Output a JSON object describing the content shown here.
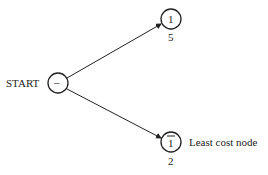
{
  "diagram": {
    "root": {
      "id": "start",
      "label": "START",
      "symbol": "–"
    },
    "nodes": [
      {
        "id": "n1",
        "symbol": "1",
        "cost": "5",
        "note": ""
      },
      {
        "id": "n1bar",
        "symbol": "1",
        "overbar": true,
        "cost": "2",
        "note": "Least cost node"
      }
    ],
    "edges": [
      {
        "from": "start",
        "to": "n1"
      },
      {
        "from": "start",
        "to": "n1bar"
      }
    ]
  }
}
